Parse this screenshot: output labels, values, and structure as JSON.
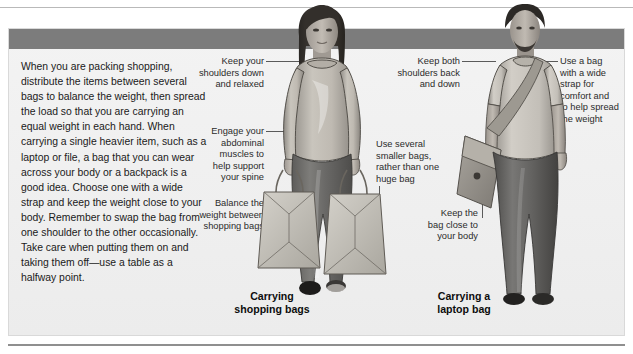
{
  "page": {
    "title_bold": "CARRYING",
    "title_light": " BAGS"
  },
  "body": {
    "paragraph": "When you are packing shopping, distribute the items between several bags to balance the weight, then spread the load so that you are carrying an equal weight in each hand. When carrying a single heavier item, such as a laptop or file, a bag that you can wear across your body or a backpack is a good idea. Choose one with a wide strap and keep the weight close to your body. Remember to swap the bag from one shoulder to the other occasionally. Take care when putting them on and taking them off—use a table as a halfway point."
  },
  "callouts": [
    {
      "id": "shoulders-down",
      "text": "Keep your\nshoulders down\nand relaxed",
      "align": "right"
    },
    {
      "id": "engage-abdominal",
      "text": "Engage your\nabdominal\nmuscles to\nhelp support\nyour spine",
      "align": "right"
    },
    {
      "id": "balance-weight",
      "text": "Balance the\nweight between\nshopping bags",
      "align": "right"
    },
    {
      "id": "shoulders-back",
      "text": "Keep both\nshoulders back\nand down",
      "align": "right"
    },
    {
      "id": "smaller-bags",
      "text": "Use several\nsmaller bags,\nrather than one\nhuge bag",
      "align": "left"
    },
    {
      "id": "bag-close",
      "text": "Keep the\nbag close to\nyour body",
      "align": "right"
    },
    {
      "id": "wide-strap",
      "text": "Use a bag\nwith a wide\nstrap for\ncomfort and\nto help spread\nthe weight",
      "align": "left"
    }
  ],
  "captions": [
    {
      "id": "carrying-shopping-bags",
      "text": "Carrying\nshopping bags"
    },
    {
      "id": "carrying-laptop-bag",
      "text": "Carrying a\nlaptop bag"
    }
  ],
  "figures": [
    {
      "id": "woman-shopping-bags",
      "label": "woman carrying two shopping bags"
    },
    {
      "id": "man-laptop-bag",
      "label": "man carrying a messenger laptop bag"
    }
  ],
  "colors": {
    "header_bar": "#7c7c7c",
    "panel_bg": "#f1f1f1",
    "panel_border": "#d9d9d9",
    "rule": "#8f8f8f",
    "text": "#1a1a1a",
    "callout_text": "#2b2b2b"
  }
}
